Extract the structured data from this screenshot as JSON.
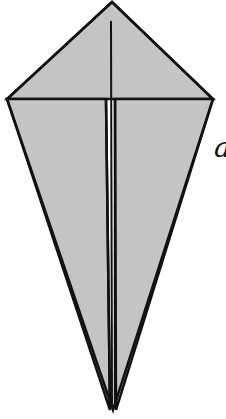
{
  "diagram": {
    "step_label": "a",
    "colors": {
      "paper_fill": "#c4c4c4",
      "outline": "#111111",
      "background": "#ffffff"
    },
    "shape": {
      "apex": [
        112,
        2
      ],
      "left_corner": [
        7,
        99
      ],
      "right_corner": [
        213,
        99
      ],
      "bottom_tip": [
        113,
        410
      ]
    },
    "folds": {
      "center_line": {
        "x": 111,
        "y_start": 21,
        "y_end": 410
      },
      "left_flap_edge": {
        "x": 106,
        "y_top": 99
      },
      "right_flap_edge": {
        "x": 115,
        "y_top": 99
      }
    }
  }
}
